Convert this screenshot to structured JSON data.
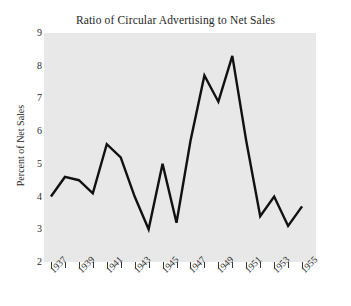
{
  "chart_data": {
    "type": "line",
    "title": "Ratio of Circular Advertising to Net Sales",
    "xlabel": "",
    "ylabel": "Percent of Net Sales",
    "xlim": [
      1936.5,
      1956.0
    ],
    "ylim": [
      2,
      9
    ],
    "yticks": [
      2,
      3,
      4,
      5,
      6,
      7,
      8,
      9
    ],
    "ytick_labels": [
      "2",
      "3",
      "4",
      "5",
      "6",
      "7",
      "8",
      "9"
    ],
    "xticks": [
      1937,
      1938,
      1939,
      1940,
      1941,
      1942,
      1943,
      1944,
      1945,
      1946,
      1947,
      1948,
      1949,
      1950,
      1951,
      1952,
      1953,
      1954,
      1955
    ],
    "xtick_labels": [
      "1937",
      "",
      "1939",
      "",
      "1941",
      "",
      "1943",
      "",
      "1945",
      "",
      "1947",
      "",
      "1949",
      "",
      "1951",
      "",
      "1953",
      "",
      "1955"
    ],
    "xtick_labels_shown": [
      "1937",
      "1939",
      "1941",
      "1943",
      "1945",
      "1947",
      "1949",
      "1951",
      "1953",
      "1955"
    ],
    "grid": false,
    "legend": false,
    "x": [
      1937,
      1938,
      1939,
      1940,
      1941,
      1942,
      1943,
      1944,
      1945,
      1946,
      1947,
      1948,
      1949,
      1950,
      1951,
      1952,
      1953,
      1954,
      1955
    ],
    "values": [
      4.0,
      4.6,
      4.5,
      4.1,
      5.6,
      5.2,
      4.0,
      3.0,
      5.0,
      3.2,
      5.7,
      7.7,
      6.9,
      8.3,
      5.7,
      3.4,
      4.0,
      3.1,
      3.7
    ],
    "series": [
      {
        "name": "Ratio of Circular Advertising to Net Sales",
        "values": [
          4.0,
          4.6,
          4.5,
          4.1,
          5.6,
          5.2,
          4.0,
          3.0,
          5.0,
          3.2,
          5.7,
          7.7,
          6.9,
          8.3,
          5.7,
          3.4,
          4.0,
          3.1,
          3.7
        ],
        "color": "#111111"
      }
    ],
    "colors": {
      "line": "#111111",
      "plot_background": "#e8e8e8",
      "figure_background": "#ffffff",
      "text": "#262626"
    }
  }
}
